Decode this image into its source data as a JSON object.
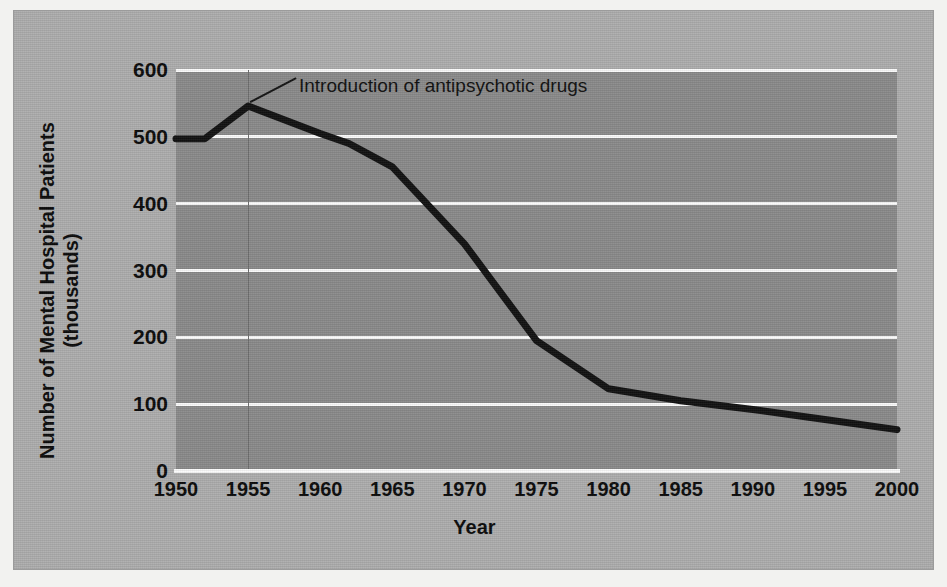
{
  "chart_data": {
    "type": "line",
    "title": "",
    "xlabel": "Year",
    "ylabel": "Number of Mental Hospital Patients (thousands)",
    "ylabel_line1": "Number of Mental Hospital Patients",
    "ylabel_line2": "(thousands)",
    "xlim": [
      1950,
      2000
    ],
    "ylim": [
      0,
      600
    ],
    "grid": true,
    "legend": "none",
    "x_ticks": [
      1950,
      1955,
      1960,
      1965,
      1970,
      1975,
      1980,
      1985,
      1990,
      1995,
      2000
    ],
    "y_ticks": [
      0,
      100,
      200,
      300,
      400,
      500,
      600
    ],
    "x": [
      1950,
      1952,
      1955,
      1960,
      1962,
      1965,
      1970,
      1975,
      1980,
      1985,
      1990,
      1995,
      2000
    ],
    "values": [
      497,
      497,
      546,
      505,
      490,
      455,
      340,
      195,
      123,
      105,
      92,
      77,
      62
    ],
    "series": [
      {
        "name": "Mental hospital patients",
        "values": [
          497,
          497,
          546,
          505,
          490,
          455,
          340,
          195,
          123,
          105,
          92,
          77,
          62
        ]
      }
    ],
    "annotations": [
      {
        "label": "Introduction of antipsychotic drugs",
        "x": 1955,
        "y": 546,
        "marker": "vertical-line-and-leader"
      }
    ],
    "colors": {
      "line": "#121212",
      "plot_background": "#8b8b8b",
      "card_background": "#aeaeae",
      "gridline": "#fbfbfb",
      "text": "#0b0b0b",
      "marker_line": "#6f6f6f"
    }
  }
}
